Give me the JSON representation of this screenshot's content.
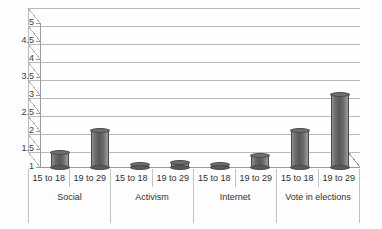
{
  "chart_data": {
    "type": "bar",
    "title": "",
    "subtitle": "",
    "xlabel": "",
    "ylabel": "",
    "ylim": [
      1,
      5
    ],
    "ytick_labels": [
      "5",
      "4.5",
      "4",
      "3.5",
      "3",
      "2.5",
      "2",
      "1.5",
      "1"
    ],
    "ytick_values": [
      5,
      4.5,
      4,
      3.5,
      3,
      2.5,
      2,
      1.5,
      1
    ],
    "grid": true,
    "legend": "none",
    "style": "3d-cylinder-bars",
    "groups": [
      "Social",
      "Activism",
      "Internet",
      "Vote in elections"
    ],
    "categories": [
      "15 to 18",
      "19 to 29",
      "15 to 18",
      "19 to 29",
      "15 to 18",
      "19 to 29",
      "15 to 18",
      "19 to 29"
    ],
    "values": [
      1.4,
      2.0,
      1.05,
      1.1,
      1.05,
      1.3,
      2.0,
      3.0
    ],
    "bars": [
      {
        "group": "Social",
        "category": "15 to 18",
        "value": 1.4
      },
      {
        "group": "Social",
        "category": "19 to 29",
        "value": 2.0
      },
      {
        "group": "Activism",
        "category": "15 to 18",
        "value": 1.05
      },
      {
        "group": "Activism",
        "category": "19 to 29",
        "value": 1.1
      },
      {
        "group": "Internet",
        "category": "15 to 18",
        "value": 1.05
      },
      {
        "group": "Internet",
        "category": "19 to 29",
        "value": 1.3
      },
      {
        "group": "Vote in elections",
        "category": "15 to 18",
        "value": 2.0
      },
      {
        "group": "Vote in elections",
        "category": "19 to 29",
        "value": 3.0
      }
    ],
    "colors": {
      "bar_fill": "#6f6f6f",
      "bar_edge": "#4a4a4a",
      "gridline": "#b9b9b9",
      "axis": "#9a9a9a",
      "text": "#2e2e2e",
      "background": "#ffffff"
    }
  },
  "axis": {
    "ticks": [
      {
        "label": "5"
      },
      {
        "label": "4.5"
      },
      {
        "label": "4"
      },
      {
        "label": "3.5"
      },
      {
        "label": "3"
      },
      {
        "label": "2.5"
      },
      {
        "label": "2"
      },
      {
        "label": "1.5"
      },
      {
        "label": "1"
      }
    ]
  },
  "categories_row": [
    {
      "label": "15 to 18"
    },
    {
      "label": "19 to 29"
    },
    {
      "label": "15 to 18"
    },
    {
      "label": "19 to 29"
    },
    {
      "label": "15 to 18"
    },
    {
      "label": "19 to 29"
    },
    {
      "label": "15 to 18"
    },
    {
      "label": "19 to 29"
    }
  ],
  "groups_row": [
    {
      "label": "Social"
    },
    {
      "label": "Activism"
    },
    {
      "label": "Internet"
    },
    {
      "label": "Vote in elections"
    }
  ]
}
